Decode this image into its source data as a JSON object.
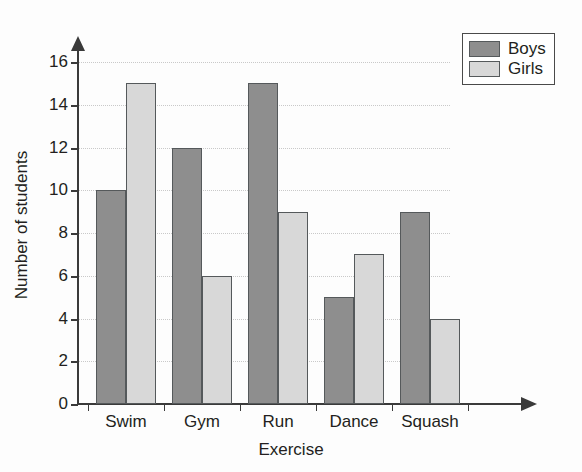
{
  "chart_data": {
    "type": "bar",
    "title": "",
    "categories": [
      "Swim",
      "Gym",
      "Run",
      "Dance",
      "Squash"
    ],
    "series": [
      {
        "name": "Boys",
        "values": [
          10,
          12,
          15,
          5,
          9
        ],
        "color": "#8e8e8e"
      },
      {
        "name": "Girls",
        "values": [
          15,
          6,
          9,
          7,
          4
        ],
        "color": "#d8d8d8"
      }
    ],
    "xlabel": "Exercise",
    "ylabel": "Number of students",
    "ylim": [
      0,
      16
    ],
    "ytick_step": 2,
    "yticks": [
      0,
      2,
      4,
      6,
      8,
      10,
      12,
      14,
      16
    ],
    "ytick_labels": [
      "0",
      "2",
      "4",
      "6",
      "8",
      "10",
      "12",
      "14",
      "16"
    ],
    "grid": true,
    "grid_axis": "y",
    "legend_position": "top-right",
    "legend_entries": [
      "Boys",
      "Girls"
    ],
    "bar_group_style": "adjacent-pairs"
  },
  "axes": {
    "y_title": "Number of students",
    "x_title": "Exercise"
  },
  "legend": {
    "entries": [
      {
        "label": "Boys",
        "swatch": "boys-swatch"
      },
      {
        "label": "Girls",
        "swatch": "girls-swatch"
      }
    ]
  },
  "icons": {
    "y_axis_arrow": "arrow-up-icon",
    "x_axis_arrow": "arrow-right-icon"
  }
}
